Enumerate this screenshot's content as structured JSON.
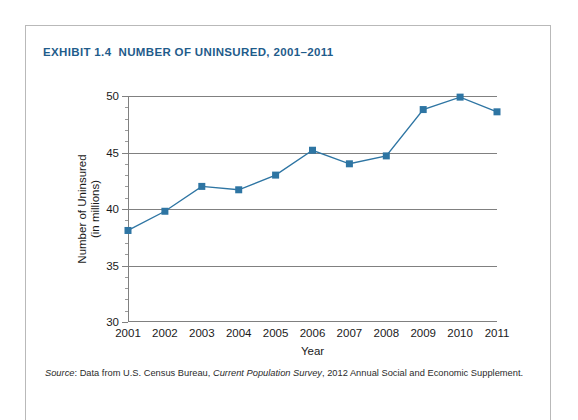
{
  "exhibit": {
    "title": "EXHIBIT 1.4  NUMBER OF UNINSURED, 2001–2011"
  },
  "source_note": {
    "label": "Source",
    "text_before_italic": ": Data from U.S. Census Bureau, ",
    "italic_work": "Current Population Survey",
    "text_after_italic": ", 2012 Annual Social and Economic Supplement."
  },
  "style": {
    "series_color": "#2e75a3",
    "title_color": "#1f5c8b",
    "grid_color": "#808080",
    "frame_color": "#b9b9b9"
  },
  "chart_data": {
    "type": "line",
    "title": "EXHIBIT 1.4  NUMBER OF UNINSURED, 2001–2011",
    "xlabel": "Year",
    "ylabel": "Number of Uninsured (in millions)",
    "ylabel_line1": "Number of Uninsured",
    "ylabel_line2": "(in millions)",
    "categories": [
      "2001",
      "2002",
      "2003",
      "2004",
      "2005",
      "2006",
      "2007",
      "2008",
      "2009",
      "2010",
      "2011"
    ],
    "values": [
      38.1,
      39.8,
      42.0,
      41.7,
      43.0,
      45.2,
      44.0,
      44.7,
      48.8,
      49.9,
      48.6
    ],
    "series": [
      {
        "name": "Number of Uninsured (in millions)",
        "values": [
          38.1,
          39.8,
          42.0,
          41.7,
          43.0,
          45.2,
          44.0,
          44.7,
          48.8,
          49.9,
          48.6
        ]
      }
    ],
    "ylim": [
      30,
      50
    ],
    "ytick_values": [
      30,
      35,
      40,
      45,
      50
    ],
    "ytick_labels": [
      "30",
      "35",
      "40",
      "45",
      "50"
    ],
    "yminor_step": 1,
    "grid": "horizontal",
    "legend": "none",
    "marker": "square"
  }
}
